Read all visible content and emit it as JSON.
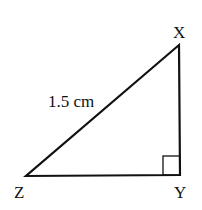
{
  "diagram": {
    "type": "right-triangle",
    "vertices": {
      "X": {
        "label": "X",
        "x": 179,
        "y": 45
      },
      "Y": {
        "label": "Y",
        "x": 180,
        "y": 175
      },
      "Z": {
        "label": "Z",
        "x": 26,
        "y": 176
      }
    },
    "right_angle_at": "Y",
    "side_labels": {
      "hypotenuse_ZX": "1.5 cm"
    },
    "stroke_color": "#111111",
    "background": "#ffffff"
  }
}
